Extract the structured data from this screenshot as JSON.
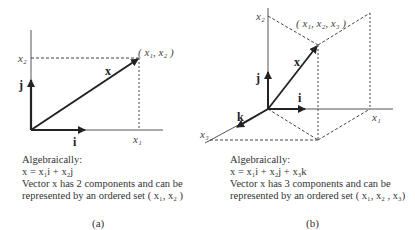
{
  "panel_a": {
    "axis_labels": {
      "x2": "x₂",
      "x1": "x₁"
    },
    "vector_labels": {
      "x": "x",
      "i": "i",
      "j": "j"
    },
    "point_label": "( x₁, x₂ )",
    "caption": {
      "heading": "Algebraically:",
      "equation": "x = x₁i + x₂j",
      "line1": "Vector x has 2 components and can be",
      "line2": "represented by an ordered set ( x₁, x₂ )"
    },
    "sub_label": "(a)"
  },
  "panel_b": {
    "axis_labels": {
      "x2": "x₂",
      "x1": "x₁",
      "x3": "x₃"
    },
    "vector_labels": {
      "x": "x",
      "i": "i",
      "j": "j",
      "k": "k"
    },
    "point_label": "( x₁, x₂, x₃ )",
    "caption": {
      "heading": "Algebraically:",
      "equation": "x = x₁i + x₂j + x₃k",
      "line1": "Vector x has 3 components and can be",
      "line2": "represented by an ordered set ( x₁, x₂ , x₃)"
    },
    "sub_label": "(b)"
  }
}
